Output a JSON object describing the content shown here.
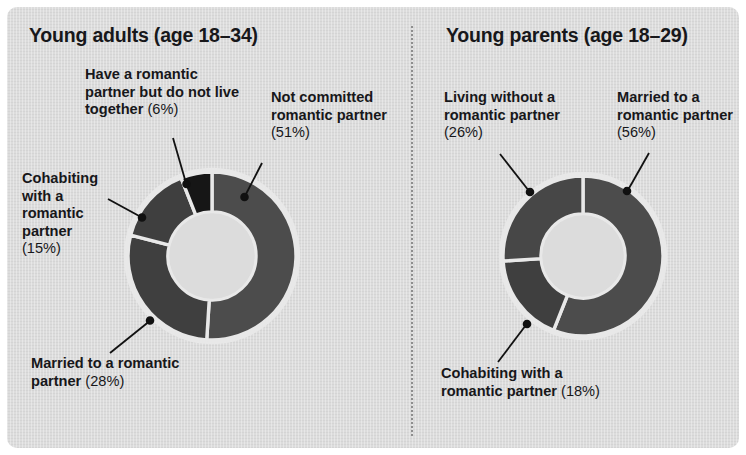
{
  "figure": {
    "background_color": "#dcdcdc",
    "border_color": "#ffffff",
    "divider": "dotted-vertical-divider"
  },
  "colors": {
    "segment_mid_gray": "#4c4c4c",
    "segment_dark_gray": "#3f3f3f",
    "segment_black": "#161616",
    "segment_gap": "#e8e8e8",
    "text": "#17171a",
    "leader_line": "#111111"
  },
  "panels": {
    "left": {
      "title": "Young adults (age 18–34)",
      "labels": {
        "top_left": {
          "text": "Have a romantic partner but do not live together",
          "pct": "(6%)"
        },
        "top_right": {
          "text": "Not committed romantic partner",
          "pct": "(51%)"
        },
        "mid_left": {
          "text": "Cohabiting with a romantic partner",
          "pct": "(15%)"
        },
        "bottom_left": {
          "text": "Married to a romantic partner",
          "pct": "(28%)"
        }
      }
    },
    "right": {
      "title": "Young parents (age 18–29)",
      "labels": {
        "top_left": {
          "text": "Living without a romantic partner",
          "pct": "(26%)"
        },
        "top_right": {
          "text": "Married to a romantic partner",
          "pct": "(56%)"
        },
        "bottom_left": {
          "text": "Cohabiting with a romantic partner",
          "pct": "(18%)"
        }
      }
    }
  },
  "chart_data": [
    {
      "type": "pie",
      "variant": "donut",
      "title": "Young adults (age 18–34)",
      "center": [
        212,
        256
      ],
      "outer_radius": 84,
      "inner_radius": 44,
      "start_angle_deg": 0,
      "direction": "clockwise",
      "labels": [
        "Not committed romantic partner",
        "Married to a romantic partner",
        "Cohabiting with a romantic partner",
        "Have a romantic partner but do not live together"
      ],
      "values": [
        51,
        28,
        15,
        6
      ],
      "value_suffix": "%",
      "slice_colors": [
        "#4c4c4c",
        "#3f3f3f",
        "#3f3f3f",
        "#161616"
      ],
      "legend": "none",
      "grid": false
    },
    {
      "type": "pie",
      "variant": "donut",
      "title": "Young parents (age 18–29)",
      "center": [
        583,
        256
      ],
      "outer_radius": 80,
      "inner_radius": 42,
      "start_angle_deg": 0,
      "direction": "clockwise",
      "labels": [
        "Married to a romantic partner",
        "Cohabiting with a romantic partner",
        "Living without a romantic partner"
      ],
      "values": [
        56,
        18,
        26
      ],
      "value_suffix": "%",
      "slice_colors": [
        "#4c4c4c",
        "#3f3f3f",
        "#474747"
      ],
      "legend": "none",
      "grid": false
    }
  ]
}
